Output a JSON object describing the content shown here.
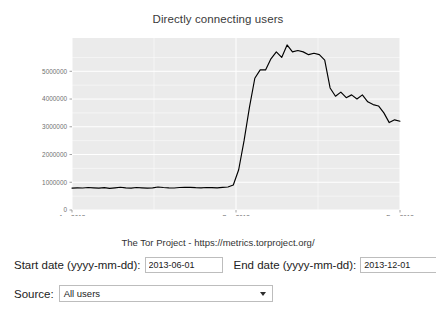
{
  "chart": {
    "title": "Directly connecting users",
    "caption": "The Tor Project - https://metrics.torproject.org/"
  },
  "chart_data": {
    "type": "line",
    "title": "Directly connecting users",
    "subtitle": "The Tor Project - https://metrics.torproject.org/",
    "xlabel": "",
    "ylabel": "",
    "grid": true,
    "legend": "none",
    "line_color": "#000000",
    "panel_color": "#ebebeb",
    "gridline_color": "#ffffff",
    "xlim": [
      "2013-06-01",
      "2013-12-01"
    ],
    "ylim": [
      0,
      6200000
    ],
    "x_ticks": [
      "Jun-2013",
      "Sep-2013",
      "Dec-2013"
    ],
    "x_tick_positions": [
      0.0,
      0.5,
      1.0
    ],
    "y_ticks": [
      0,
      1000000,
      2000000,
      3000000,
      4000000,
      5000000
    ],
    "y_tick_labels": [
      "0",
      "1000000",
      "2000000",
      "3000000",
      "4000000",
      "5000000"
    ],
    "x": [
      "2013-06-01",
      "2013-06-04",
      "2013-06-07",
      "2013-06-10",
      "2013-06-13",
      "2013-06-16",
      "2013-06-19",
      "2013-06-22",
      "2013-06-25",
      "2013-06-28",
      "2013-07-01",
      "2013-07-04",
      "2013-07-07",
      "2013-07-10",
      "2013-07-13",
      "2013-07-16",
      "2013-07-19",
      "2013-07-22",
      "2013-07-25",
      "2013-07-28",
      "2013-07-31",
      "2013-08-03",
      "2013-08-06",
      "2013-08-09",
      "2013-08-12",
      "2013-08-15",
      "2013-08-18",
      "2013-08-21",
      "2013-08-24",
      "2013-08-27",
      "2013-08-30",
      "2013-09-02",
      "2013-09-05",
      "2013-09-08",
      "2013-09-11",
      "2013-09-14",
      "2013-09-17",
      "2013-09-20",
      "2013-09-23",
      "2013-09-26",
      "2013-09-29",
      "2013-10-02",
      "2013-10-05",
      "2013-10-08",
      "2013-10-11",
      "2013-10-14",
      "2013-10-17",
      "2013-10-20",
      "2013-10-23",
      "2013-10-26",
      "2013-10-29",
      "2013-11-01",
      "2013-11-04",
      "2013-11-07",
      "2013-11-10",
      "2013-11-13",
      "2013-11-16",
      "2013-11-19",
      "2013-11-22",
      "2013-11-25",
      "2013-11-28",
      "2013-12-01"
    ],
    "values": [
      790000,
      800000,
      795000,
      810000,
      800000,
      790000,
      805000,
      780000,
      800000,
      820000,
      800000,
      790000,
      810000,
      800000,
      790000,
      800000,
      830000,
      810000,
      800000,
      795000,
      810000,
      820000,
      815000,
      805000,
      800000,
      810000,
      805000,
      800000,
      815000,
      830000,
      900000,
      1450000,
      2500000,
      3700000,
      4750000,
      5050000,
      5050000,
      5450000,
      5700000,
      5500000,
      5950000,
      5700000,
      5750000,
      5700000,
      5600000,
      5650000,
      5600000,
      5400000,
      4400000,
      4100000,
      4250000,
      4050000,
      4150000,
      4000000,
      4150000,
      3900000,
      3800000,
      3750000,
      3500000,
      3150000,
      3250000,
      3200000
    ]
  },
  "form": {
    "start_date_label": "Start date (yyyy-mm-dd):",
    "start_date_value": "2013-06-01",
    "end_date_label": "End date (yyyy-mm-dd):",
    "end_date_value": "2013-12-01",
    "source_label": "Source:",
    "source_value": "All users",
    "source_options": [
      "All users"
    ]
  }
}
